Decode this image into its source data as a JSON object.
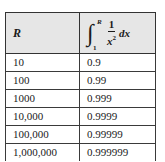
{
  "table": {
    "headers": {
      "col1": "R",
      "col2": {
        "integral_sign": "∫",
        "upper_limit": "R",
        "lower_limit": "1",
        "numerator": "1",
        "denominator_base": "x",
        "denominator_exp": "2",
        "differential": "dx"
      }
    },
    "rows": [
      {
        "r": "10",
        "value": "0.9"
      },
      {
        "r": "100",
        "value": "0.99"
      },
      {
        "r": "1000",
        "value": "0.999"
      },
      {
        "r": "10,000",
        "value": "0.9999"
      },
      {
        "r": "100,000",
        "value": "0.99999"
      },
      {
        "r": "1,000,000",
        "value": "0.999999"
      }
    ]
  },
  "colors": {
    "header_bg": "#e6e6e6",
    "border": "#3a3a3a",
    "text": "#1a1a1a"
  }
}
